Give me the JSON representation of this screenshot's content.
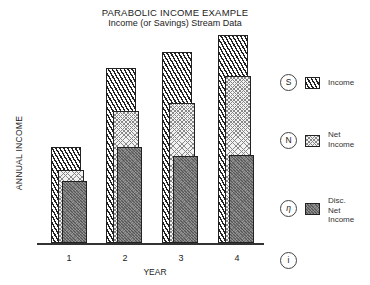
{
  "chart_data": {
    "type": "bar",
    "title": "PARABOLIC INCOME EXAMPLE",
    "subtitle": "Income (or Savings) Stream Data",
    "xlabel": "YEAR",
    "ylabel": "ANNUAL INCOME",
    "categories": [
      "1",
      "2",
      "3",
      "4"
    ],
    "series": [
      {
        "name": "Income",
        "symbol": "S",
        "values": [
          96,
          175,
          191,
          208
        ]
      },
      {
        "name": "Net Income",
        "symbol": "N",
        "values": [
          73,
          132,
          140,
          167
        ]
      },
      {
        "name": "Disc. Net Income",
        "symbol": "η",
        "values": [
          62,
          96,
          87,
          88
        ]
      }
    ],
    "units": "relative (no y-axis scale shown)",
    "grid": false,
    "legend_position": "right",
    "extra_legend_symbol": "i"
  },
  "header": {
    "title": "PARABOLIC INCOME EXAMPLE",
    "subtitle": "Income (or Savings) Stream Data"
  },
  "axes": {
    "ylabel": "ANNUAL INCOME",
    "xlabel": "YEAR",
    "xticks": [
      "1",
      "2",
      "3",
      "4"
    ]
  },
  "legend": {
    "items": [
      {
        "symbol": "S",
        "label_lines": [
          "Income"
        ]
      },
      {
        "symbol": "N",
        "label_lines": [
          "Net",
          "Income"
        ]
      },
      {
        "symbol": "η",
        "label_lines": [
          "Disc.",
          "Net",
          "Income"
        ]
      },
      {
        "symbol": "i",
        "label_lines": []
      }
    ]
  }
}
